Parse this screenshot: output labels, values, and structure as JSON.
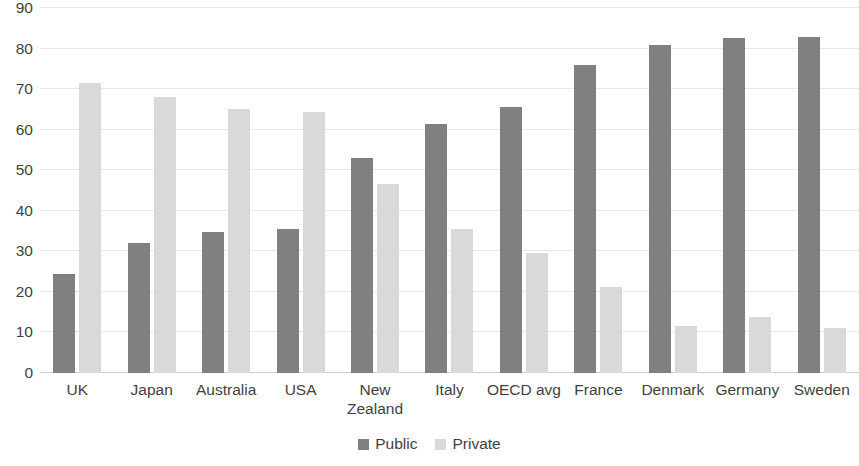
{
  "chart_data": {
    "type": "bar",
    "title": "",
    "subtitle": "",
    "xlabel": "",
    "ylabel": "",
    "ylim": [
      0,
      90
    ],
    "yticks": [
      0,
      10,
      20,
      30,
      40,
      50,
      60,
      70,
      80,
      90
    ],
    "grid": true,
    "legend_position": "bottom-center",
    "categories": [
      "UK",
      "Japan",
      "Australia",
      "USA",
      "New Zealand",
      "Italy",
      "OECD avg",
      "France",
      "Denmark",
      "Germany",
      "Sweden"
    ],
    "series": [
      {
        "name": "Public",
        "color": "#808080",
        "values": [
          24.5,
          32.0,
          34.7,
          35.6,
          53.0,
          61.5,
          65.5,
          76.0,
          81.0,
          82.5,
          82.8
        ]
      },
      {
        "name": "Private",
        "color": "#d9d9d9",
        "values": [
          71.5,
          68.0,
          65.0,
          64.3,
          46.5,
          35.5,
          29.5,
          21.3,
          11.5,
          13.8,
          11.0
        ]
      }
    ]
  },
  "axis": {
    "y_tick_labels": [
      "90",
      "80",
      "70",
      "60",
      "50",
      "40",
      "30",
      "20",
      "10",
      "0"
    ]
  },
  "legend": {
    "items": [
      {
        "label": "Public",
        "color": "#808080"
      },
      {
        "label": "Private",
        "color": "#d9d9d9"
      }
    ]
  }
}
